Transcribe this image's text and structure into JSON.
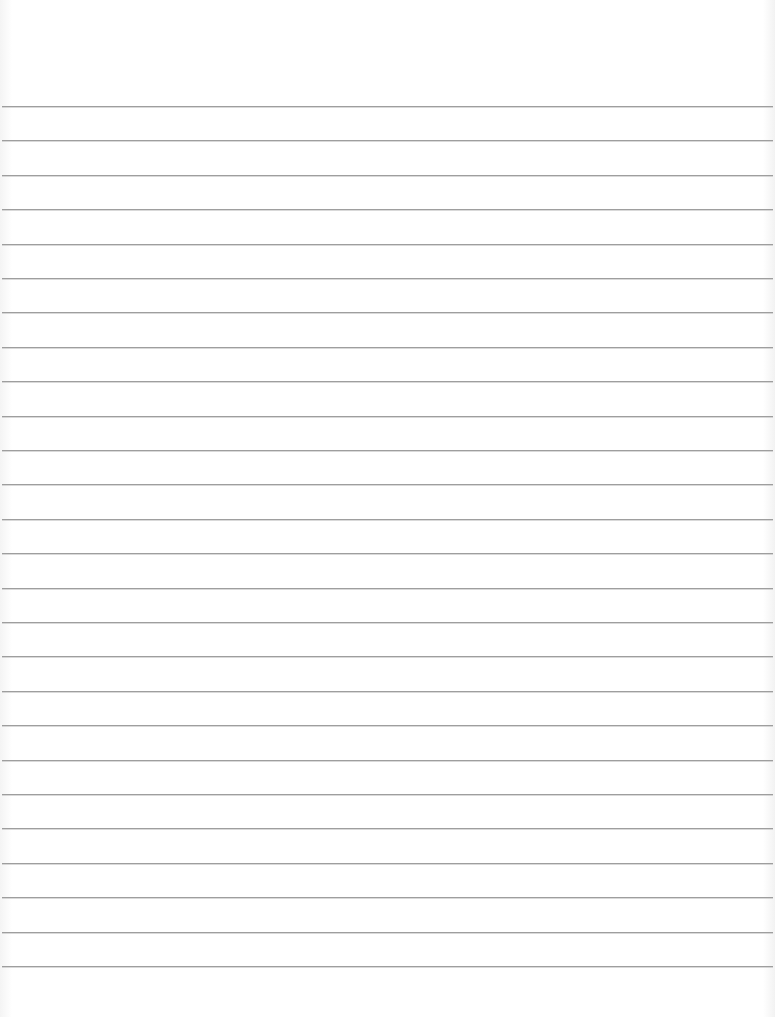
{
  "sheet": {
    "type": "lined-paper",
    "background_color": "#ffffff",
    "line_color": "#9e9e9e",
    "first_line_y": 106,
    "line_spacing": 34.4,
    "line_count": 26
  }
}
